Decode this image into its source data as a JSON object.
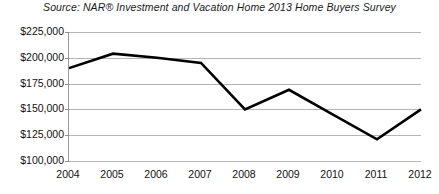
{
  "chart_data": {
    "type": "line",
    "title": "Source: NAR® Investment and Vacation Home 2013 Home Buyers Survey",
    "xlabel": "",
    "ylabel": "",
    "categories": [
      "2004",
      "2005",
      "2006",
      "2007",
      "2008",
      "2009",
      "2010",
      "2011",
      "2012"
    ],
    "values": [
      190000,
      204000,
      200000,
      195000,
      150000,
      169000,
      145000,
      121000,
      150000
    ],
    "series": [
      {
        "name": "Median vacation home price",
        "values": [
          190000,
          204000,
          200000,
          195000,
          150000,
          169000,
          145000,
          121000,
          150000
        ]
      }
    ],
    "ylim": [
      100000,
      225000
    ],
    "ytick_values": [
      225000,
      200000,
      175000,
      150000,
      125000,
      100000
    ],
    "ytick_labels": [
      "$225,000",
      "$200,000",
      "$175,000",
      "$150,000",
      "$125,000",
      "$100,000"
    ],
    "grid": true,
    "legend": false,
    "line_color": "#000000",
    "grid_color": "#b5b5b5",
    "axis_color": "#9a9a9a",
    "background_color": "#ffffff"
  }
}
